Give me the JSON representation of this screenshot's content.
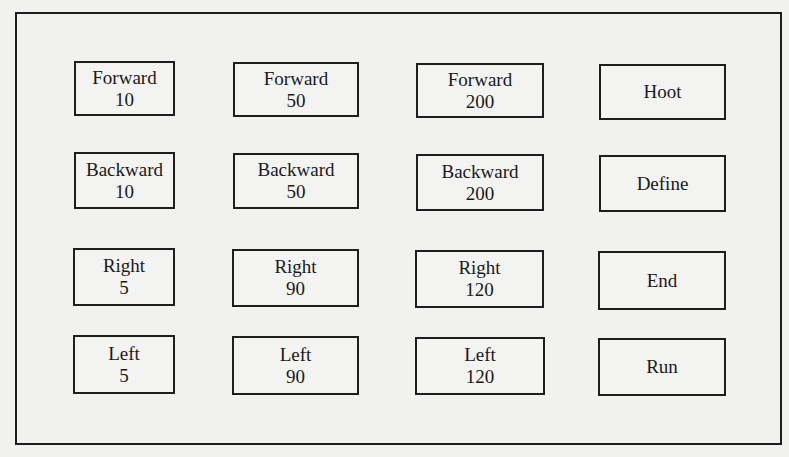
{
  "keypad": {
    "rows": [
      [
        {
          "label": "Forward",
          "value": "10"
        },
        {
          "label": "Forward",
          "value": "50"
        },
        {
          "label": "Forward",
          "value": "200"
        },
        {
          "label": "Hoot",
          "value": ""
        }
      ],
      [
        {
          "label": "Backward",
          "value": "10"
        },
        {
          "label": "Backward",
          "value": "50"
        },
        {
          "label": "Backward",
          "value": "200"
        },
        {
          "label": "Define",
          "value": ""
        }
      ],
      [
        {
          "label": "Right",
          "value": "5"
        },
        {
          "label": "Right",
          "value": "90"
        },
        {
          "label": "Right",
          "value": "120"
        },
        {
          "label": "End",
          "value": ""
        }
      ],
      [
        {
          "label": "Left",
          "value": "5"
        },
        {
          "label": "Left",
          "value": "90"
        },
        {
          "label": "Left",
          "value": "120"
        },
        {
          "label": "Run",
          "value": ""
        }
      ]
    ]
  }
}
